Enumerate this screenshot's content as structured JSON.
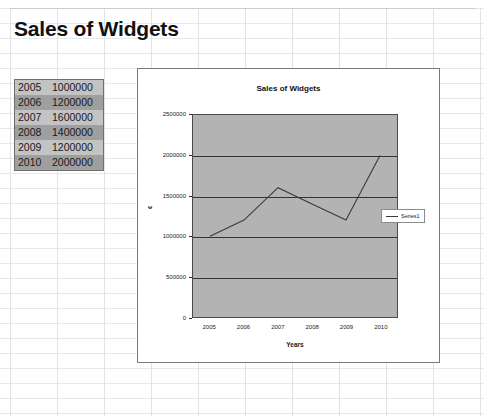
{
  "document": {
    "top_cropped_text": "",
    "worksheet_title": "Sales of Widgets"
  },
  "data_table": {
    "columns": [
      "year",
      "value"
    ],
    "rows": [
      {
        "year": "2005",
        "value": "1000000"
      },
      {
        "year": "2006",
        "value": "1200000"
      },
      {
        "year": "2007",
        "value": "1600000"
      },
      {
        "year": "2008",
        "value": "1400000"
      },
      {
        "year": "2009",
        "value": "1200000"
      },
      {
        "year": "2010",
        "value": "2000000"
      }
    ]
  },
  "chart_data": {
    "type": "line",
    "title": "Sales of Widgets",
    "xlabel": "Years",
    "ylabel": "€",
    "categories": [
      "2005",
      "2006",
      "2007",
      "2008",
      "2009",
      "2010"
    ],
    "series": [
      {
        "name": "Series1",
        "values": [
          1000000,
          1200000,
          1600000,
          1400000,
          1200000,
          2000000
        ]
      }
    ],
    "ylim": [
      0,
      2500000
    ],
    "yticks": [
      "0",
      "500000",
      "1000000",
      "1500000",
      "2000000",
      "2500000"
    ],
    "xticks": [
      "2005",
      "2006",
      "2007",
      "2008",
      "2009",
      "2010"
    ],
    "grid": true,
    "legend_position": "right",
    "plot_background_color": "#b3b3b3",
    "series_line_color": "#3b3b3b"
  }
}
